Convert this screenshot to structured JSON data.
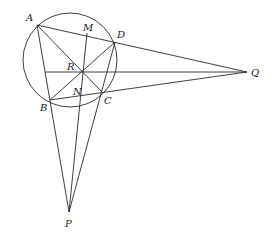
{
  "diagram": {
    "type": "geometry-cyclic-quadrilateral",
    "circle": {
      "cx": 70,
      "cy": 60,
      "r": 47
    },
    "points": {
      "A": {
        "x": 37,
        "y": 25,
        "label": "A",
        "lx": 26,
        "ly": 21
      },
      "B": {
        "x": 50,
        "y": 100,
        "label": "B",
        "lx": 40,
        "ly": 111
      },
      "C": {
        "x": 102,
        "y": 92,
        "label": "C",
        "lx": 104,
        "ly": 104
      },
      "D": {
        "x": 115,
        "y": 42,
        "label": "D",
        "lx": 116,
        "ly": 38
      },
      "M": {
        "x": 87,
        "y": 33,
        "label": "M",
        "lx": 83,
        "ly": 31
      },
      "N": {
        "x": 80,
        "y": 96,
        "label": "N",
        "lx": 73,
        "ly": 95
      },
      "R": {
        "x": 83,
        "y": 72,
        "label": "R",
        "lx": 67,
        "ly": 70
      },
      "P": {
        "x": 69,
        "y": 212,
        "label": "P",
        "lx": 65,
        "ly": 227
      },
      "Q": {
        "x": 247,
        "y": 72,
        "label": "Q",
        "lx": 251,
        "ly": 76
      }
    },
    "segments": [
      [
        "A",
        "Q"
      ],
      [
        "A",
        "P"
      ],
      [
        "A",
        "C"
      ],
      [
        "B",
        "D"
      ],
      [
        "B",
        "Q"
      ],
      [
        "D",
        "P"
      ],
      [
        "M",
        "P"
      ],
      [
        "H",
        "Q"
      ]
    ],
    "extra_points": {
      "H": {
        "x": 45,
        "y": 72
      }
    }
  }
}
